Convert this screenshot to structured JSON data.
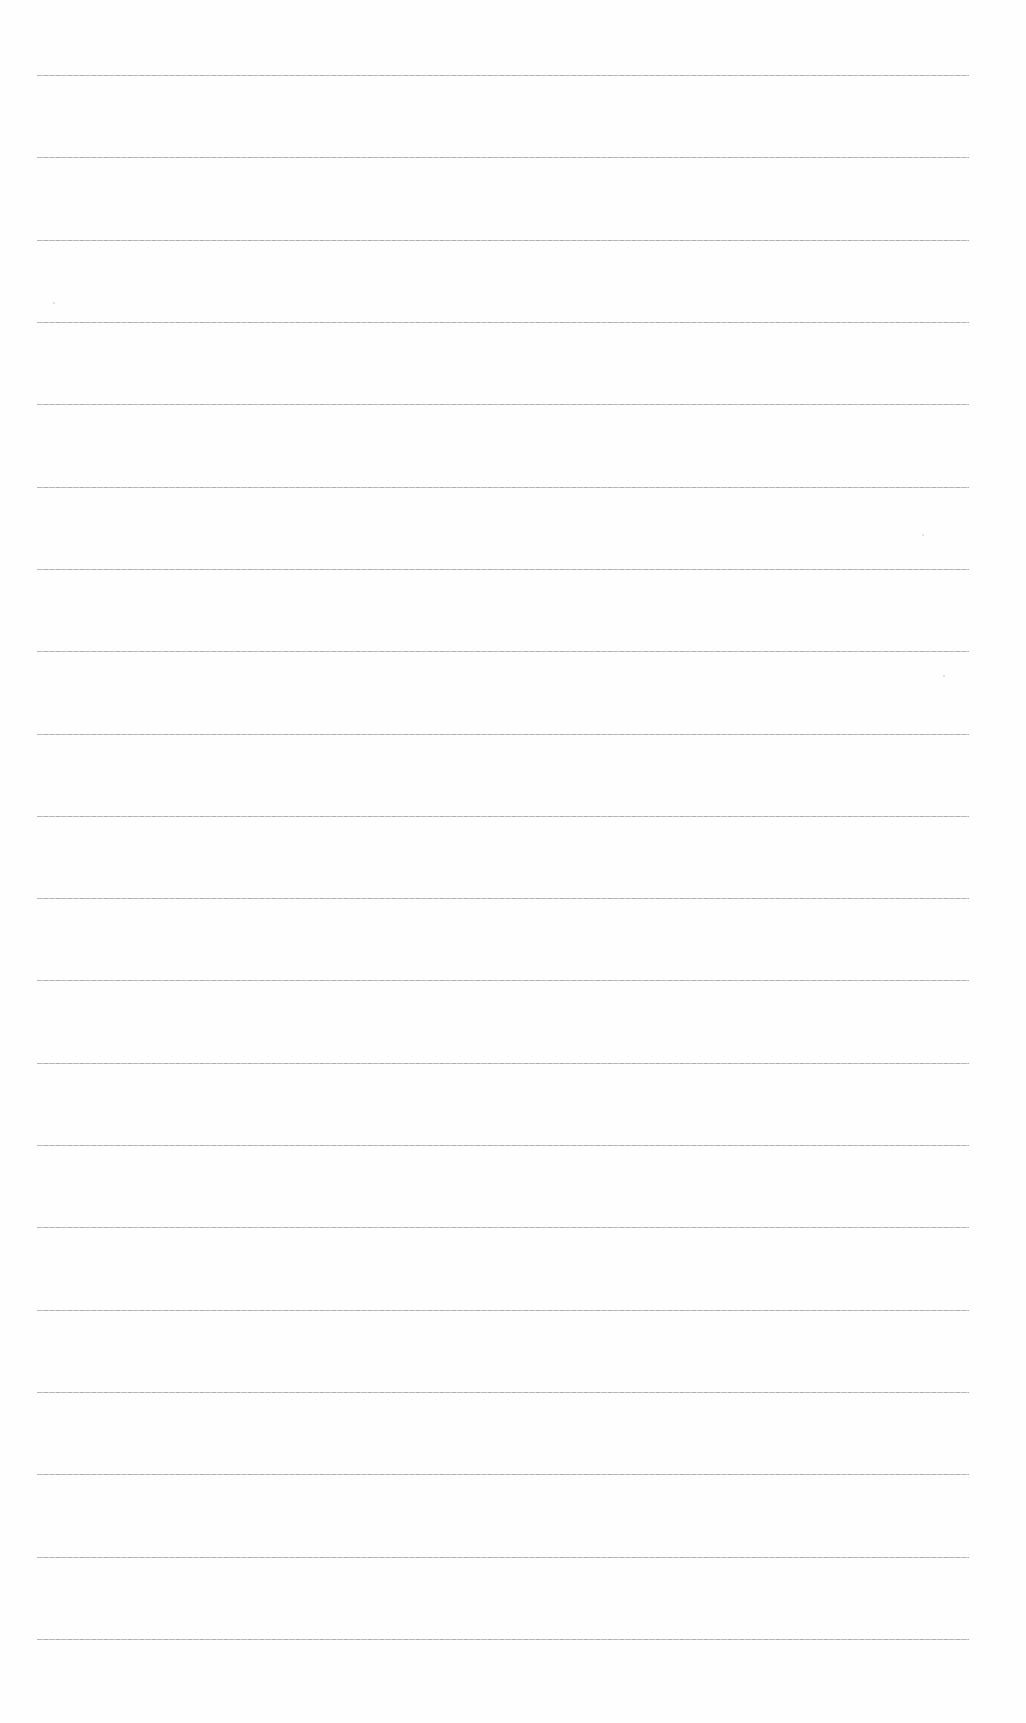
{
  "page": {
    "type": "blank ruled sheet",
    "background": "#fefefe",
    "line_color": "#a9a9a9",
    "line_count": 20,
    "line_left": 37,
    "line_right": 969,
    "first_line_y": 75,
    "last_line_y": 1639
  },
  "lines": [
    75,
    157,
    240,
    322,
    404,
    487,
    569,
    651,
    734,
    816,
    898,
    980,
    1063,
    1145,
    1227,
    1310,
    1392,
    1474,
    1557,
    1639
  ],
  "specks": [
    {
      "x": 53,
      "y": 302
    },
    {
      "x": 922,
      "y": 534
    },
    {
      "x": 943,
      "y": 675
    }
  ]
}
